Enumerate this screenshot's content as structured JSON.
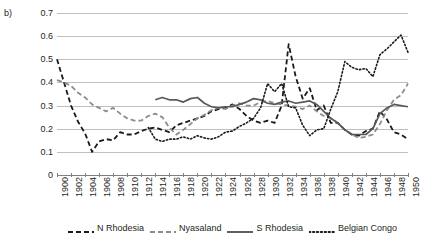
{
  "panel": {
    "label": "b)"
  },
  "chart_data": {
    "type": "line",
    "title": "",
    "subtitle": "",
    "xlabel": "",
    "ylabel": "",
    "xlim": [
      1900,
      1950
    ],
    "ylim": [
      0,
      0.7
    ],
    "grid": true,
    "legend_position": "bottom",
    "y_ticks": [
      "0",
      "0.1",
      "0.2",
      "0.3",
      "0.4",
      "0.5",
      "0.6",
      "0.7"
    ],
    "y_tick_values": [
      0,
      0.1,
      0.2,
      0.3,
      0.4,
      0.5,
      0.6,
      0.7
    ],
    "x_ticks": [
      "1900",
      "1902",
      "1904",
      "1906",
      "1908",
      "1910",
      "1912",
      "1914",
      "1916",
      "1918",
      "1920",
      "1922",
      "1924",
      "1926",
      "1928",
      "1930",
      "1932",
      "1934",
      "1936",
      "1938",
      "1940",
      "1942",
      "1944",
      "1946",
      "1948",
      "1950"
    ],
    "x_tick_values": [
      1900,
      1902,
      1904,
      1906,
      1908,
      1910,
      1912,
      1914,
      1916,
      1918,
      1920,
      1922,
      1924,
      1926,
      1928,
      1930,
      1932,
      1934,
      1936,
      1938,
      1940,
      1942,
      1944,
      1946,
      1948,
      1950
    ],
    "x": [
      1900,
      1901,
      1902,
      1903,
      1904,
      1905,
      1906,
      1907,
      1908,
      1909,
      1910,
      1911,
      1912,
      1913,
      1914,
      1915,
      1916,
      1917,
      1918,
      1919,
      1920,
      1921,
      1922,
      1923,
      1924,
      1925,
      1926,
      1927,
      1928,
      1929,
      1930,
      1931,
      1932,
      1933,
      1934,
      1935,
      1936,
      1937,
      1938,
      1939,
      1940,
      1941,
      1942,
      1943,
      1944,
      1945,
      1946,
      1947,
      1948,
      1949,
      1950
    ],
    "series": [
      {
        "name": "N Rhodesia",
        "color": "#1a1a1a",
        "style": "dashed",
        "values": [
          0.5,
          0.4,
          0.3,
          0.23,
          0.18,
          0.1,
          0.145,
          0.155,
          0.15,
          0.185,
          0.175,
          0.175,
          0.19,
          0.2,
          0.205,
          0.195,
          0.185,
          0.215,
          0.225,
          0.235,
          0.245,
          0.255,
          0.275,
          0.285,
          0.29,
          0.305,
          0.285,
          0.255,
          0.235,
          0.225,
          0.235,
          0.225,
          0.3,
          0.565,
          0.425,
          0.33,
          0.375,
          0.28,
          0.3,
          0.225,
          0.225,
          0.195,
          0.175,
          0.17,
          0.19,
          0.2,
          0.275,
          0.24,
          0.185,
          0.175,
          0.155
        ]
      },
      {
        "name": "Nyasaland",
        "color": "#8c8c8c",
        "style": "dashed",
        "values": [
          0.41,
          0.4,
          0.385,
          0.355,
          0.335,
          0.305,
          0.29,
          0.275,
          0.29,
          0.265,
          0.245,
          0.235,
          0.235,
          0.255,
          0.265,
          0.25,
          0.205,
          0.175,
          0.195,
          0.22,
          0.245,
          0.26,
          0.28,
          0.29,
          0.285,
          0.3,
          0.31,
          0.3,
          0.3,
          0.315,
          0.32,
          0.31,
          0.305,
          0.3,
          0.295,
          0.285,
          0.3,
          0.275,
          0.255,
          0.245,
          0.225,
          0.195,
          0.175,
          0.16,
          0.165,
          0.175,
          0.22,
          0.28,
          0.325,
          0.345,
          0.395
        ]
      },
      {
        "name": "S Rhodesia",
        "color": "#595959",
        "style": "solid",
        "values": [
          null,
          null,
          null,
          null,
          null,
          null,
          null,
          null,
          null,
          null,
          null,
          null,
          null,
          null,
          0.325,
          0.335,
          0.325,
          0.325,
          0.315,
          0.33,
          0.335,
          0.31,
          0.295,
          0.29,
          0.295,
          0.295,
          0.305,
          0.315,
          0.33,
          0.325,
          0.31,
          0.305,
          0.315,
          0.32,
          0.31,
          0.315,
          0.32,
          0.305,
          0.275,
          0.245,
          0.225,
          0.195,
          0.175,
          0.175,
          0.175,
          0.2,
          0.265,
          0.29,
          0.305,
          0.3,
          0.295
        ]
      },
      {
        "name": "Belgian Congo",
        "color": "#1a1a1a",
        "style": "dotted",
        "values": [
          null,
          null,
          null,
          null,
          null,
          null,
          null,
          null,
          null,
          null,
          null,
          null,
          null,
          0.205,
          0.155,
          0.145,
          0.155,
          0.155,
          0.165,
          0.155,
          0.17,
          0.16,
          0.155,
          0.165,
          0.185,
          0.19,
          0.21,
          0.225,
          0.245,
          0.29,
          0.395,
          0.36,
          0.395,
          0.295,
          0.29,
          0.215,
          0.17,
          0.195,
          0.2,
          0.285,
          0.36,
          0.49,
          0.465,
          0.455,
          0.46,
          0.425,
          0.52,
          0.545,
          0.575,
          0.605,
          0.53
        ]
      }
    ]
  },
  "legend": {
    "items": [
      {
        "label": "N Rhodesia",
        "style": "dashed",
        "color": "#1a1a1a"
      },
      {
        "label": "Nyasaland",
        "style": "dashed",
        "color": "#8c8c8c"
      },
      {
        "label": "S Rhodesia",
        "style": "solid",
        "color": "#595959"
      },
      {
        "label": "Belgian Congo",
        "style": "dotted",
        "color": "#1a1a1a"
      }
    ]
  }
}
